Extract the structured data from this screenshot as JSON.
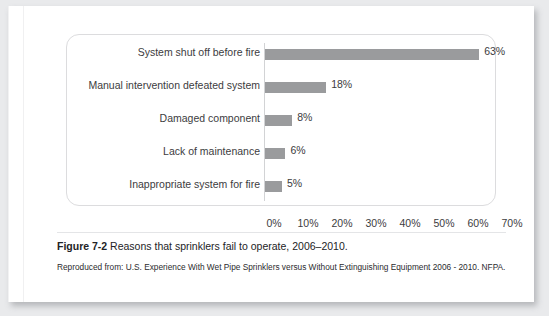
{
  "chart_data": {
    "type": "bar",
    "orientation": "horizontal",
    "title": "",
    "xlabel": "",
    "ylabel": "",
    "xlim": [
      0,
      70
    ],
    "grid": false,
    "legend": null,
    "bar_color": "#9a9b9d",
    "tick_labels": [
      "0%",
      "10%",
      "20%",
      "30%",
      "40%",
      "50%",
      "60%",
      "70%"
    ],
    "tick_values": [
      0,
      10,
      20,
      30,
      40,
      50,
      60,
      70
    ],
    "categories": [
      "System shut off before fire",
      "Manual intervention defeated system",
      "Damaged component",
      "Lack of maintenance",
      "Inappropriate system for fire"
    ],
    "values": [
      63,
      18,
      8,
      6,
      5
    ],
    "data_labels": [
      "63%",
      "18%",
      "8%",
      "6%",
      "5%"
    ]
  },
  "caption": {
    "figure_label": "Figure 7-2",
    "text": "Reasons that sprinklers fail to operate, 2006–2010.",
    "attribution": "Reproduced from: U.S. Experience With Wet Pipe Sprinklers versus Without Extinguishing Equipment 2006 - 2010. NFPA."
  }
}
